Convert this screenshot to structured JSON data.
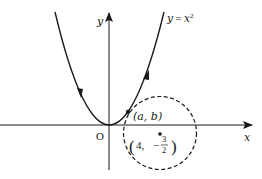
{
  "diagram": {
    "curve_label": "y = x²",
    "curve_label_parts": {
      "lhs": "y",
      "eq": " = ",
      "base": "x",
      "exp": "2"
    },
    "axis_x_label": "x",
    "axis_y_label": "y",
    "origin_label": "O",
    "point_label": "(a, b)",
    "center_label": {
      "open": "(",
      "x": "4,",
      "sign": "−",
      "frac_num": "3",
      "frac_den": "2",
      "close": ")"
    },
    "colors": {
      "stroke": "#1a1a1a",
      "background": "#ffffff"
    }
  }
}
